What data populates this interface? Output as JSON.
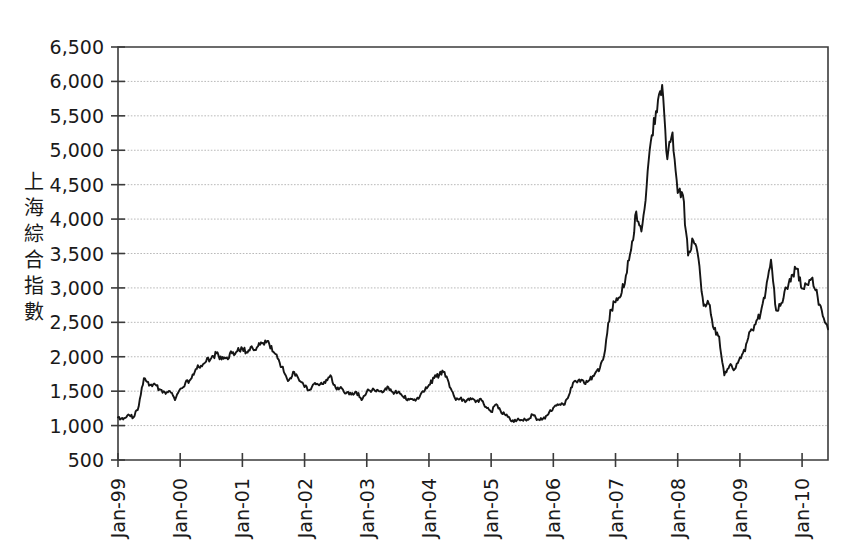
{
  "chart_data": {
    "type": "line",
    "title": "",
    "subtitle": "",
    "xlabel": "",
    "ylabel": "上海綜合指數",
    "ylim": [
      500,
      6500
    ],
    "ytick_values": [
      500,
      1000,
      1500,
      2000,
      2500,
      3000,
      3500,
      4000,
      4500,
      5000,
      5500,
      6000,
      6500
    ],
    "ytick_labels": [
      "500",
      "1,000",
      "1,500",
      "2,000",
      "2,500",
      "3,000",
      "3,500",
      "4,000",
      "4,500",
      "5,000",
      "5,500",
      "6,000",
      "6,500"
    ],
    "xtick_labels": [
      "Jan-99",
      "Jan-00",
      "Jan-01",
      "Jan-02",
      "Jan-03",
      "Jan-04",
      "Jan-05",
      "Jan-06",
      "Jan-07",
      "Jan-08",
      "Jan-09",
      "Jan-10"
    ],
    "xlim": [
      "Jan-99",
      "Jul-10"
    ],
    "grid": "horizontal",
    "legend": "none",
    "series": [
      {
        "name": "上海綜合指數",
        "color": "#151515",
        "x": [
          "Jan-99",
          "Feb-99",
          "Mar-99",
          "Apr-99",
          "May-99",
          "Jun-99",
          "Jul-99",
          "Aug-99",
          "Sep-99",
          "Oct-99",
          "Nov-99",
          "Dec-99",
          "Jan-00",
          "Feb-00",
          "Mar-00",
          "Apr-00",
          "May-00",
          "Jun-00",
          "Jul-00",
          "Aug-00",
          "Sep-00",
          "Oct-00",
          "Nov-00",
          "Dec-00",
          "Jan-01",
          "Feb-01",
          "Mar-01",
          "Apr-01",
          "May-01",
          "Jun-01",
          "Jul-01",
          "Aug-01",
          "Sep-01",
          "Oct-01",
          "Nov-01",
          "Dec-01",
          "Jan-02",
          "Feb-02",
          "Mar-02",
          "Apr-02",
          "May-02",
          "Jun-02",
          "Jul-02",
          "Aug-02",
          "Sep-02",
          "Oct-02",
          "Nov-02",
          "Dec-02",
          "Jan-03",
          "Feb-03",
          "Mar-03",
          "Apr-03",
          "May-03",
          "Jun-03",
          "Jul-03",
          "Aug-03",
          "Sep-03",
          "Oct-03",
          "Nov-03",
          "Dec-03",
          "Jan-04",
          "Feb-04",
          "Mar-04",
          "Apr-04",
          "May-04",
          "Jun-04",
          "Jul-04",
          "Aug-04",
          "Sep-04",
          "Oct-04",
          "Nov-04",
          "Dec-04",
          "Jan-05",
          "Feb-05",
          "Mar-05",
          "Apr-05",
          "May-05",
          "Jun-05",
          "Jul-05",
          "Aug-05",
          "Sep-05",
          "Oct-05",
          "Nov-05",
          "Dec-05",
          "Jan-06",
          "Feb-06",
          "Mar-06",
          "Apr-06",
          "May-06",
          "Jun-06",
          "Jul-06",
          "Aug-06",
          "Sep-06",
          "Oct-06",
          "Nov-06",
          "Dec-06",
          "Jan-07",
          "Feb-07",
          "Mar-07",
          "Apr-07",
          "May-07",
          "Jun-07",
          "Jul-07",
          "Aug-07",
          "Sep-07",
          "Oct-07",
          "Nov-07",
          "Dec-07",
          "Jan-08",
          "Feb-08",
          "Mar-08",
          "Apr-08",
          "May-08",
          "Jun-08",
          "Jul-08",
          "Aug-08",
          "Sep-08",
          "Oct-08",
          "Nov-08",
          "Dec-08",
          "Jan-09",
          "Feb-09",
          "Mar-09",
          "Apr-09",
          "May-09",
          "Jun-09",
          "Jul-09",
          "Aug-09",
          "Sep-09",
          "Oct-09",
          "Nov-09",
          "Dec-09",
          "Jan-10",
          "Feb-10",
          "Mar-10",
          "Apr-10",
          "May-10",
          "Jun-10"
        ],
        "values": [
          1120,
          1090,
          1160,
          1120,
          1280,
          1690,
          1580,
          1610,
          1530,
          1490,
          1500,
          1370,
          1530,
          1620,
          1670,
          1820,
          1870,
          1930,
          1980,
          2050,
          1960,
          1990,
          2050,
          2080,
          2120,
          2060,
          2120,
          2150,
          2200,
          2230,
          2070,
          1960,
          1780,
          1660,
          1780,
          1650,
          1560,
          1520,
          1620,
          1600,
          1620,
          1730,
          1550,
          1560,
          1470,
          1450,
          1490,
          1370,
          1490,
          1510,
          1520,
          1480,
          1570,
          1490,
          1480,
          1420,
          1390,
          1370,
          1390,
          1490,
          1590,
          1690,
          1740,
          1780,
          1560,
          1400,
          1390,
          1340,
          1400,
          1340,
          1390,
          1270,
          1200,
          1310,
          1180,
          1160,
          1060,
          1080,
          1080,
          1090,
          1160,
          1090,
          1100,
          1160,
          1260,
          1300,
          1300,
          1440,
          1640,
          1670,
          1610,
          1660,
          1750,
          1840,
          2100,
          2680,
          2790,
          2880,
          3180,
          3550,
          4110,
          3820,
          4470,
          5220,
          5550,
          5950,
          4870,
          5260,
          4380,
          4350,
          3470,
          3690,
          3430,
          2740,
          2770,
          2400,
          2290,
          1730,
          1870,
          1820,
          1990,
          2080,
          2370,
          2470,
          2630,
          2960,
          3410,
          2670,
          2780,
          3000,
          3190,
          3280,
          2990,
          3050,
          3150,
          2870,
          2590,
          2400
        ]
      }
    ],
    "annotations": {
      "peak_value": 6100,
      "peak_label": "Oct-07",
      "trough_value": 1000,
      "trough_label": "Jun-05"
    }
  },
  "axes": {
    "y_axis_title": "上海綜合指數",
    "plot_area": {
      "left": 118,
      "top": 47,
      "right": 828,
      "bottom": 460
    }
  }
}
